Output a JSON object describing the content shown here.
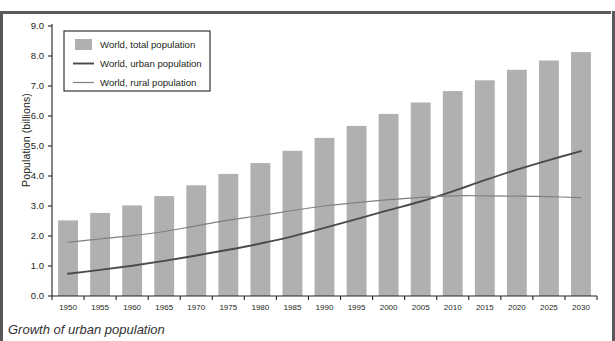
{
  "caption": "Growth of urban population",
  "colors": {
    "bar": "#b0b0b0",
    "urban_line": "#4a4a4a",
    "rural_line": "#808080",
    "axis": "#231f20",
    "rule": "#5a585a",
    "background": "#ffffff"
  },
  "legend": {
    "position": "top-left",
    "items": [
      {
        "label": "World, total population",
        "marker": "swatch",
        "color": "#b0b0b0"
      },
      {
        "label": "World, urban population",
        "marker": "line",
        "color": "#4a4a4a"
      },
      {
        "label": "World, rural population",
        "marker": "line",
        "color": "#808080"
      }
    ]
  },
  "chart_data": {
    "type": "bar",
    "title": "",
    "subtitle": "",
    "xlabel": "",
    "ylabel": "Population (billions)",
    "xlim": [
      1947.5,
      2032.5
    ],
    "ylim": [
      0.0,
      9.0
    ],
    "grid": false,
    "ytick_labels": [
      "0.0",
      "1.0",
      "2.0",
      "3.0",
      "4.0",
      "5.0",
      "6.0",
      "7.0",
      "8.0",
      "9.0"
    ],
    "ytick_values": [
      0.0,
      1.0,
      2.0,
      3.0,
      4.0,
      5.0,
      6.0,
      7.0,
      8.0,
      9.0
    ],
    "categories": [
      1950,
      1955,
      1960,
      1965,
      1970,
      1975,
      1980,
      1985,
      1990,
      1995,
      2000,
      2005,
      2010,
      2015,
      2020,
      2025,
      2030
    ],
    "xtick_labels": [
      "1950",
      "1955",
      "1960",
      "1965",
      "1970",
      "1975",
      "1980",
      "1985",
      "1990",
      "1995",
      "2000",
      "2005",
      "2010",
      "2015",
      "2020",
      "2025",
      "2030"
    ],
    "series": [
      {
        "name": "World, total population",
        "type": "bar",
        "color": "#b0b0b0",
        "values": [
          2.52,
          2.77,
          3.02,
          3.33,
          3.69,
          4.07,
          4.43,
          4.84,
          5.27,
          5.67,
          6.07,
          6.45,
          6.83,
          7.19,
          7.54,
          7.85,
          8.13
        ]
      },
      {
        "name": "World, urban population",
        "type": "line",
        "color": "#4a4a4a",
        "values": [
          0.74,
          0.87,
          1.01,
          1.17,
          1.35,
          1.54,
          1.75,
          1.99,
          2.27,
          2.56,
          2.86,
          3.15,
          3.49,
          3.86,
          4.21,
          4.53,
          4.83
        ]
      },
      {
        "name": "World, rural population",
        "type": "line",
        "color": "#808080",
        "values": [
          1.79,
          1.9,
          2.01,
          2.15,
          2.34,
          2.53,
          2.68,
          2.85,
          3.0,
          3.11,
          3.21,
          3.29,
          3.34,
          3.34,
          3.33,
          3.31,
          3.28
        ]
      }
    ]
  }
}
